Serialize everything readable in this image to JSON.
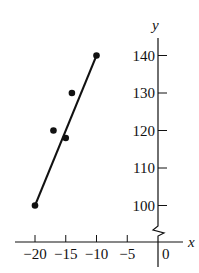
{
  "chart_data": {
    "type": "scatter",
    "title": "",
    "xlabel": "x",
    "ylabel": "y",
    "x_ticks": [
      -20,
      -15,
      -10,
      -5,
      0
    ],
    "x_tick_labels": [
      "−20",
      "−15",
      "−10",
      "−5",
      "0"
    ],
    "y_ticks": [
      100,
      110,
      120,
      130,
      140
    ],
    "y_tick_labels": [
      "100",
      "110",
      "120",
      "130",
      "140"
    ],
    "xlim": [
      -22,
      1
    ],
    "ylim": [
      95,
      144
    ],
    "y_axis_break": true,
    "grid": false,
    "legend": null,
    "series": [
      {
        "name": "data points",
        "type": "scatter",
        "points": [
          [
            -20,
            100
          ],
          [
            -17,
            120
          ],
          [
            -15,
            118
          ],
          [
            -14,
            130
          ],
          [
            -10,
            140
          ]
        ]
      },
      {
        "name": "fitted line",
        "type": "line",
        "points": [
          [
            -20,
            100
          ],
          [
            -10,
            140
          ]
        ]
      }
    ]
  },
  "colors": {
    "ink": "#111111",
    "background": "#ffffff"
  }
}
